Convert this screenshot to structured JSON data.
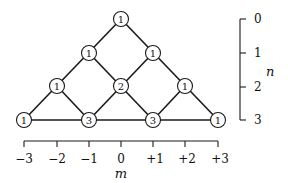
{
  "diagram": {
    "type": "pascal-like lattice (number of paths)",
    "nodes": [
      {
        "n": 0,
        "m": 0,
        "value": "1"
      },
      {
        "n": 1,
        "m": -1,
        "value": "1"
      },
      {
        "n": 1,
        "m": 1,
        "value": "1"
      },
      {
        "n": 2,
        "m": -2,
        "value": "1"
      },
      {
        "n": 2,
        "m": 0,
        "value": "2"
      },
      {
        "n": 2,
        "m": 2,
        "value": "1"
      },
      {
        "n": 3,
        "m": -3,
        "value": "1"
      },
      {
        "n": 3,
        "m": -1,
        "value": "3"
      },
      {
        "n": 3,
        "m": 1,
        "value": "3"
      },
      {
        "n": 3,
        "m": 3,
        "value": "1"
      }
    ],
    "x_axis": {
      "title": "m",
      "ticks": [
        "−3",
        "−2",
        "−1",
        "0",
        "+1",
        "+2",
        "+3"
      ]
    },
    "y_axis": {
      "title": "n",
      "ticks": [
        "0",
        "1",
        "2",
        "3"
      ]
    }
  }
}
